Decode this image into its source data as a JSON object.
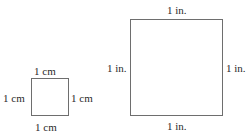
{
  "small_square": {
    "unit_label": "1 cm",
    "labels": {
      "top": "1 cm",
      "bottom": "1 cm",
      "left": "1 cm",
      "right": "1 cm"
    }
  },
  "large_square": {
    "unit_label": "1 in.",
    "labels": {
      "top": "1 in.",
      "bottom": "1 in.",
      "left": "1 in.",
      "right": "1 in."
    }
  }
}
